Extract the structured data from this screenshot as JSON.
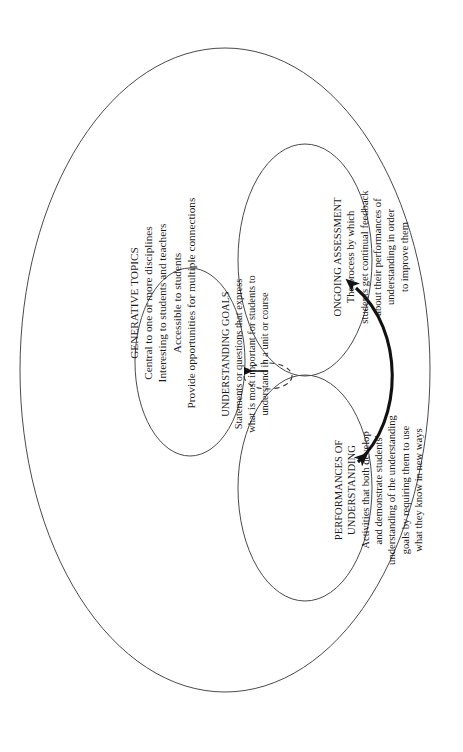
{
  "figure": {
    "orientation": "rotated-90-ccw",
    "background_color": "#ffffff",
    "line_color": "#3a3a3a",
    "arrow_color": "#111111"
  },
  "outer_region": {
    "name": "generative-topics",
    "title": "GENERATIVE TOPICS",
    "lines": [
      "Central to one or more disciplines",
      "Interesting to students and teachers",
      "Accessible to students",
      "Provide opportunities for multiple connections"
    ]
  },
  "regions": [
    {
      "name": "understanding-goals",
      "title": "UNDERSTANDING GOALS",
      "lines": [
        "Statements or questions that express",
        "what is most important for students to",
        "understand in a unit or course"
      ]
    },
    {
      "name": "ongoing-assessment",
      "title": "ONGOING ASSESSMENT",
      "lines": [
        "The process by which",
        "students get continual feedback",
        "about their performances of",
        "understanding in order",
        "to improve them"
      ]
    },
    {
      "name": "performances-of-understanding",
      "title_lines": [
        "PERFORMANCES OF",
        "UNDERSTANDING"
      ],
      "lines": [
        "Activities that both develop",
        "and demonstrate students'",
        "understanding of the understanding",
        "goals by requiring them to use",
        "what they know in new ways"
      ]
    }
  ],
  "connectors": [
    {
      "name": "straight-arrow-to-understanding-goals",
      "style": "solid single-headed arrow",
      "from": "overlap of ongoing assessment and performances of understanding",
      "to": "understanding goals"
    },
    {
      "name": "double-headed-curved-arrow",
      "style": "thick curved double-headed arrow",
      "from": "performances of understanding",
      "to": "ongoing assessment"
    },
    {
      "name": "dashed-overlap-ellipse",
      "style": "small dashed ellipse marking the overlap region"
    }
  ]
}
